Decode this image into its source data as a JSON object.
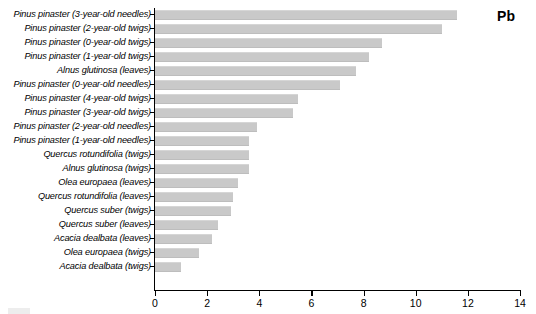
{
  "chart_data": {
    "type": "bar",
    "orientation": "horizontal",
    "title": "Pb",
    "xlabel": "",
    "ylabel": "",
    "xlim": [
      0,
      14
    ],
    "xticks": [
      0,
      2,
      4,
      6,
      8,
      10,
      12,
      14
    ],
    "grid": false,
    "legend": "none",
    "bar_color": "#c9c9c9",
    "axis_color": "#000000",
    "categories": [
      "Pinus pinaster (3-year-old needles)",
      "Pinus pinaster (2-year-old twigs)",
      "Pinus pinaster (0-year-old twigs)",
      "Pinus pinaster (1-year-old twigs)",
      "Alnus glutinosa (leaves)",
      "Pinus pinaster (0-year-old needles)",
      "Pinus pinaster (4-year-old twigs)",
      "Pinus pinaster (3-year-old twigs)",
      "Pinus pinaster (2-year-old needles)",
      "Pinus pinaster (1-year-old needles)",
      "Quercus rotundifolia (twigs)",
      "Alnus glutinosa (twigs)",
      "Olea europaea (leaves)",
      "Quercus rotundifolia (leaves)",
      "Quercus suber (twigs)",
      "Quercus suber (leaves)",
      "Acacia dealbata (leaves)",
      "Olea europaea (twigs)",
      "Acacia dealbata (twigs)"
    ],
    "values": [
      11.6,
      11.0,
      8.7,
      8.2,
      7.7,
      7.1,
      5.5,
      5.3,
      3.9,
      3.6,
      3.6,
      3.6,
      3.2,
      3.0,
      2.9,
      2.4,
      2.2,
      1.7,
      1.0
    ]
  }
}
